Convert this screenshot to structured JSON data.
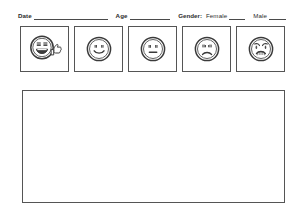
{
  "form": {
    "fields": [
      {
        "id": "date",
        "label": "Date",
        "value": "",
        "rule_class": "date"
      },
      {
        "id": "age",
        "label": "Age",
        "value": "",
        "rule_class": "age"
      }
    ],
    "gender": {
      "prefix": "Gender:",
      "options": [
        {
          "id": "female",
          "label": "Female",
          "value": ""
        },
        {
          "id": "male",
          "label": "Male",
          "value": ""
        }
      ]
    }
  },
  "scale": {
    "faces": [
      {
        "id": "face-1",
        "icon": "laughing-face-thumbs-up-icon",
        "expression": "laughing",
        "label": ""
      },
      {
        "id": "face-2",
        "icon": "smiling-face-icon",
        "expression": "smiling",
        "label": ""
      },
      {
        "id": "face-3",
        "icon": "neutral-face-icon",
        "expression": "neutral",
        "label": ""
      },
      {
        "id": "face-4",
        "icon": "frowning-face-icon",
        "expression": "frowning",
        "label": ""
      },
      {
        "id": "face-5",
        "icon": "crying-face-icon",
        "expression": "crying",
        "label": ""
      }
    ]
  },
  "response_area": {
    "value": "",
    "placeholder": ""
  },
  "colors": {
    "ink": "#2b2b2b",
    "border": "#555555",
    "rule": "#4a4a4a",
    "paper": "#ffffff"
  }
}
